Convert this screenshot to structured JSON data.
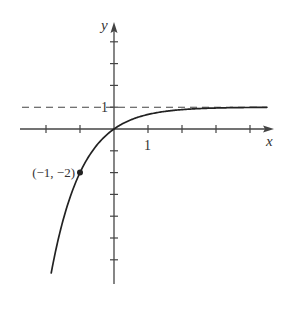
{
  "chart_data": {
    "type": "line",
    "title": "",
    "xlabel": "x",
    "ylabel": "y",
    "function": "y = 1 - 3^(-x)",
    "xlim": [
      -2.8,
      4.6
    ],
    "ylim": [
      -7.2,
      4.8
    ],
    "x_ticks": [
      -2,
      -1,
      0,
      1,
      2,
      3,
      4
    ],
    "y_ticks": [
      -6,
      -5,
      -4,
      -3,
      -2,
      -1,
      0,
      1,
      2,
      3,
      4
    ],
    "x_tick_labels": [
      {
        "value": 1,
        "text": "1"
      }
    ],
    "y_tick_labels": [
      {
        "value": 1,
        "text": "1"
      }
    ],
    "asymptote": {
      "type": "horizontal",
      "y": 1,
      "style": "dashed",
      "label": "1"
    },
    "points": [
      {
        "x": -1,
        "y": -2,
        "label": "(−1, −2)"
      }
    ],
    "series": [
      {
        "name": "curve",
        "x_range": [
          -1.85,
          4.5
        ]
      }
    ],
    "grid": false,
    "legend": null
  },
  "labels": {
    "x_axis": "x",
    "y_axis": "y",
    "x_tick_one": "1",
    "y_tick_one": "1",
    "point": "(−1, −2)"
  },
  "colors": {
    "ink": "#222222",
    "axis": "#444444"
  },
  "layout": {
    "origin_px": [
      114,
      129
    ],
    "unit_x_px": 34,
    "unit_y_px": 21.8
  }
}
